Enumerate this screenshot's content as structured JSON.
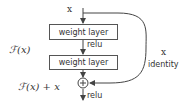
{
  "diagram": {
    "type": "residual-block",
    "input_label": "x",
    "layers": [
      {
        "label": "weight layer"
      },
      {
        "label": "weight layer"
      }
    ],
    "activation_mid": "relu",
    "activation_out": "relu",
    "residual_function_label": "ℱ(x)",
    "sum_label": "ℱ(x) + x",
    "shortcut_x_label": "x",
    "shortcut_label": "identity",
    "sum_symbol": "+"
  }
}
